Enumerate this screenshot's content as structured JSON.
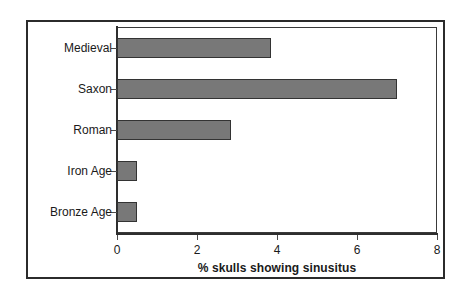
{
  "chart_data": {
    "type": "bar",
    "orientation": "horizontal",
    "title": "",
    "xlabel": "% skulls showing sinusitus",
    "ylabel": "",
    "categories": [
      "Medieval",
      "Saxon",
      "Roman",
      "Iron Age",
      "Bronze Age"
    ],
    "values": [
      3.85,
      7.0,
      2.85,
      0.5,
      0.5
    ],
    "xlim": [
      0,
      8
    ],
    "x_ticks": [
      0,
      2,
      4,
      6,
      8
    ],
    "x_tick_labels": [
      "0",
      "2",
      "4",
      "6",
      "8"
    ],
    "grid": false,
    "legend": null,
    "bar_color": "#787878",
    "bar_border_color": "#333333",
    "axis_color": "#2e2e2e",
    "frame_color": "#2b2b2b",
    "background_color": "#ffffff",
    "series": [
      {
        "name": "% skulls showing sinusitus",
        "values": [
          3.85,
          7.0,
          2.85,
          0.5,
          0.5
        ]
      }
    ],
    "points": [
      {
        "category": "Medieval",
        "value": 3.85
      },
      {
        "category": "Saxon",
        "value": 7.0
      },
      {
        "category": "Roman",
        "value": 2.85
      },
      {
        "category": "Iron Age",
        "value": 0.5
      },
      {
        "category": "Bronze Age",
        "value": 0.5
      }
    ]
  }
}
